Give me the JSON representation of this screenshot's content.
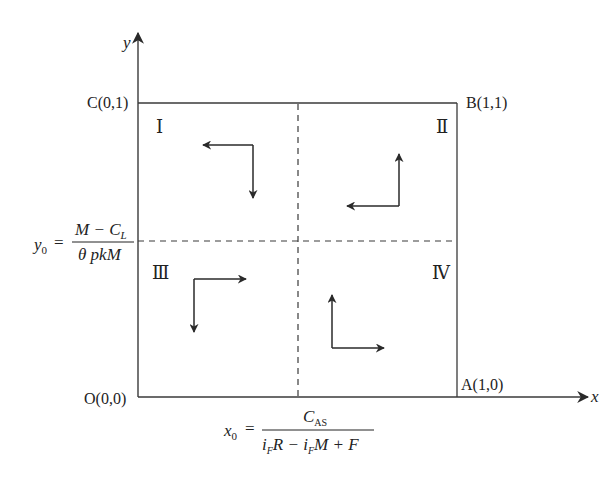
{
  "diagram": {
    "axes": {
      "x_label": "x",
      "y_label": "y"
    },
    "points": {
      "origin": "O(0,0)",
      "a": "A(1,0)",
      "b": "B(1,1)",
      "c": "C(0,1)"
    },
    "quadrants": {
      "q1": "Ⅰ",
      "q2": "Ⅱ",
      "q3": "Ⅲ",
      "q4": "Ⅳ"
    },
    "formulas": {
      "y0": {
        "lhs": "y",
        "lhs_sub": "0",
        "eq": "=",
        "num_main": "M − C",
        "num_sub": "L",
        "den": "θ pkM"
      },
      "x0": {
        "lhs": "x",
        "lhs_sub": "0",
        "eq": "=",
        "num_main": "C",
        "num_sub": "AS",
        "den_i1": "i",
        "den_sub1": "F",
        "den_r": "R − ",
        "den_i2": "i",
        "den_sub2": "F",
        "den_rest": "M + F"
      }
    },
    "colors": {
      "line": "#3a3a3a",
      "text": "#222222",
      "background": "#ffffff"
    }
  }
}
